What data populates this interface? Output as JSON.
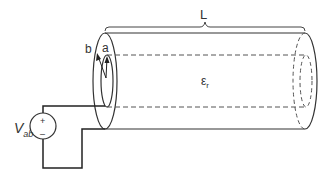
{
  "diagram": {
    "labels": {
      "length": "L",
      "outer_conductor": "b",
      "inner_conductor": "a",
      "permittivity_symbol": "ε",
      "permittivity_sub": "r",
      "source_symbol": "V",
      "source_sub": "ab",
      "plus": "+",
      "minus": "–"
    },
    "colors": {
      "stroke": "#333333",
      "dashed": "#555555",
      "background": "#ffffff"
    }
  }
}
